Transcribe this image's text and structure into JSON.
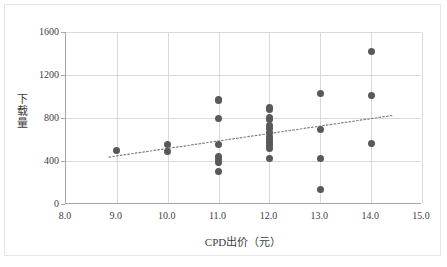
{
  "chart_data": {
    "type": "scatter",
    "title": "",
    "xlabel": "CPD出价（元）",
    "ylabel": "下载量",
    "xlim": [
      8.0,
      15.0
    ],
    "ylim": [
      0,
      1600
    ],
    "xticks": [
      "8.0",
      "9.0",
      "10.0",
      "11.0",
      "12.0",
      "13.0",
      "14.0",
      "15.0"
    ],
    "xtick_values": [
      8.0,
      9.0,
      10.0,
      11.0,
      12.0,
      13.0,
      14.0,
      15.0
    ],
    "yticks": [
      "0",
      "400",
      "800",
      "1200",
      "1600"
    ],
    "ytick_values": [
      0,
      400,
      800,
      1200,
      1600
    ],
    "grid": "both",
    "legend": "none",
    "marker_color": "#595959",
    "gridline_color": "#d9d9d9",
    "axis_color": "#a6a6a6",
    "points": [
      {
        "x": 9.0,
        "y": 500
      },
      {
        "x": 10.0,
        "y": 555
      },
      {
        "x": 10.0,
        "y": 490
      },
      {
        "x": 11.0,
        "y": 975
      },
      {
        "x": 11.0,
        "y": 960
      },
      {
        "x": 11.0,
        "y": 795
      },
      {
        "x": 11.0,
        "y": 550
      },
      {
        "x": 11.0,
        "y": 440
      },
      {
        "x": 11.0,
        "y": 410
      },
      {
        "x": 11.0,
        "y": 385
      },
      {
        "x": 11.0,
        "y": 305
      },
      {
        "x": 12.0,
        "y": 900
      },
      {
        "x": 12.0,
        "y": 875
      },
      {
        "x": 12.0,
        "y": 805
      },
      {
        "x": 12.0,
        "y": 785
      },
      {
        "x": 12.0,
        "y": 730
      },
      {
        "x": 12.0,
        "y": 700
      },
      {
        "x": 12.0,
        "y": 665
      },
      {
        "x": 12.0,
        "y": 630
      },
      {
        "x": 12.0,
        "y": 600
      },
      {
        "x": 12.0,
        "y": 570
      },
      {
        "x": 12.0,
        "y": 540
      },
      {
        "x": 12.0,
        "y": 520
      },
      {
        "x": 12.0,
        "y": 425
      },
      {
        "x": 13.0,
        "y": 1030
      },
      {
        "x": 13.0,
        "y": 690
      },
      {
        "x": 13.0,
        "y": 420
      },
      {
        "x": 13.0,
        "y": 135
      },
      {
        "x": 14.0,
        "y": 1420
      },
      {
        "x": 14.0,
        "y": 1010
      },
      {
        "x": 14.0,
        "y": 560
      }
    ],
    "trendline": {
      "style": "dotted",
      "color": "#808080",
      "x_start": 8.85,
      "y_start": 430,
      "x_end": 14.45,
      "y_end": 820
    }
  }
}
